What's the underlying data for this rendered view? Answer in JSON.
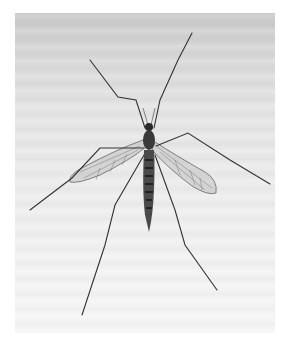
{
  "image": {
    "subject": "crane fly",
    "description": "Black-and-white photograph of a crane fly (Tipulidae) seen from above, resting on a pale surface with long spindly legs splayed outward and translucent veined wings spread.",
    "colors": {
      "background": "#ffffff",
      "surface_top": "#c9c9c9",
      "surface_bottom": "#f5f5f5",
      "insect_body": "#2a2a2a",
      "legs": "#3a3a3a",
      "wing_fill": "#b8b8b8"
    }
  }
}
